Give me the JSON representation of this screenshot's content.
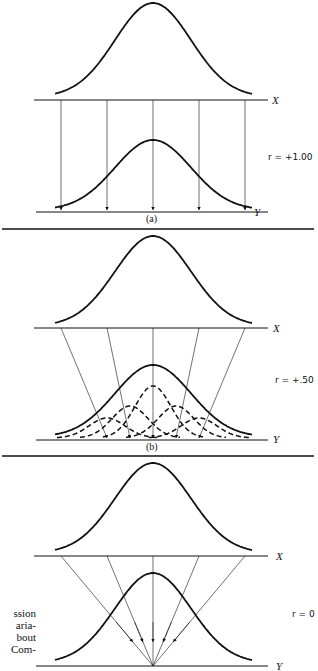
{
  "panels": [
    {
      "id": "a",
      "caption": "(a)",
      "x_label": "X",
      "y_label": "Y",
      "r_label": "r = +1.00",
      "r_value": 1.0
    },
    {
      "id": "b",
      "caption": "(b)",
      "x_label": "X",
      "y_label": "Y",
      "r_label": "r = +.50",
      "r_value": 0.5
    },
    {
      "id": "c",
      "caption": "",
      "x_label": "X",
      "y_label": "Y",
      "r_label": "r = 0",
      "r_value": 0
    }
  ],
  "side_text": [
    "ssion",
    "aria-",
    "bout",
    "Com-"
  ],
  "colors": {
    "ink": "#111111",
    "background": "#ffffff"
  }
}
